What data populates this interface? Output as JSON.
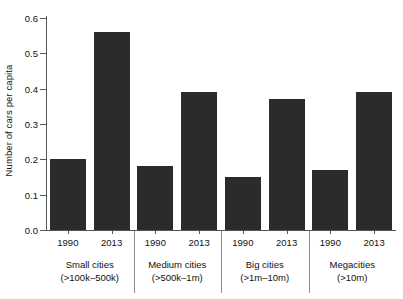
{
  "chart_data": {
    "type": "bar",
    "title": "",
    "subtitle": "",
    "xlabel": "",
    "ylabel": "Number of cars per capita",
    "ylim": [
      0.0,
      0.6
    ],
    "grid": false,
    "legend": "none",
    "y_ticks": [
      "0.0",
      "0.1",
      "0.2",
      "0.3",
      "0.4",
      "0.5",
      "0.6"
    ],
    "y_tick_values": [
      0.0,
      0.1,
      0.2,
      0.3,
      0.4,
      0.5,
      0.6
    ],
    "categories": [
      "Small cities (>100k–500k)",
      "Medium cities (>500k–1m)",
      "Big cities (>1m–10m)",
      "Megacities (>10m)"
    ],
    "series": [
      {
        "name": "1990",
        "values": [
          0.2,
          0.18,
          0.15,
          0.17
        ]
      },
      {
        "name": "2013",
        "values": [
          0.56,
          0.39,
          0.37,
          0.39
        ]
      }
    ],
    "bars": [
      {
        "group": "Small cities",
        "year": "1990",
        "value": 0.2
      },
      {
        "group": "Small cities",
        "year": "2013",
        "value": 0.56
      },
      {
        "group": "Medium cities",
        "year": "1990",
        "value": 0.18
      },
      {
        "group": "Medium cities",
        "year": "2013",
        "value": 0.39
      },
      {
        "group": "Big cities",
        "year": "1990",
        "value": 0.15
      },
      {
        "group": "Big cities",
        "year": "2013",
        "value": 0.37
      },
      {
        "group": "Megacities",
        "year": "1990",
        "value": 0.17
      },
      {
        "group": "Megacities",
        "year": "2013",
        "value": 0.39
      }
    ],
    "bar_color": "#2b2b2b",
    "axis_color": "#555555",
    "background": "#ffffff"
  },
  "axis": {
    "y_title": "Number of cars per capita",
    "ticks": [
      {
        "label": "0.0"
      },
      {
        "label": "0.1"
      },
      {
        "label": "0.2"
      },
      {
        "label": "0.3"
      },
      {
        "label": "0.4"
      },
      {
        "label": "0.5"
      },
      {
        "label": "0.6"
      }
    ]
  },
  "groups": [
    {
      "name": "Small cities",
      "range": "(>100k–500k)",
      "years": [
        {
          "label": "1990",
          "value": 0.2
        },
        {
          "label": "2013",
          "value": 0.56
        }
      ]
    },
    {
      "name": "Medium cities",
      "range": "(>500k–1m)",
      "years": [
        {
          "label": "1990",
          "value": 0.18
        },
        {
          "label": "2013",
          "value": 0.39
        }
      ]
    },
    {
      "name": "Big cities",
      "range": "(>1m–10m)",
      "years": [
        {
          "label": "1990",
          "value": 0.15
        },
        {
          "label": "2013",
          "value": 0.37
        }
      ]
    },
    {
      "name": "Megacities",
      "range": "(>10m)",
      "years": [
        {
          "label": "1990",
          "value": 0.17
        },
        {
          "label": "2013",
          "value": 0.39
        }
      ]
    }
  ]
}
